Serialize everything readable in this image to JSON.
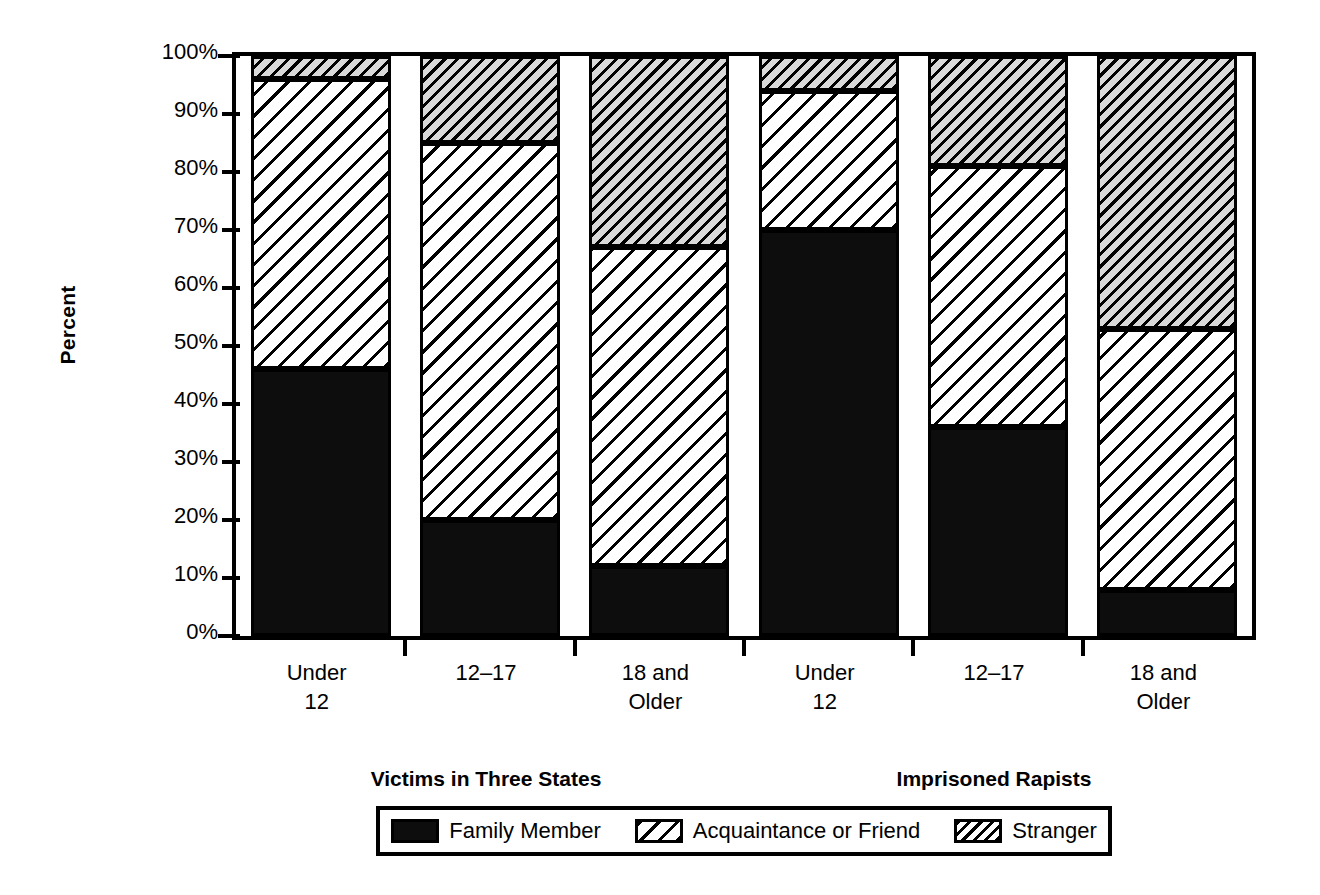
{
  "chart_data": {
    "type": "bar",
    "subtype": "stacked-percent",
    "title": "",
    "xlabel": "",
    "ylabel": "Percent",
    "ylim": [
      0,
      100
    ],
    "yticks": [
      0,
      10,
      20,
      30,
      40,
      50,
      60,
      70,
      80,
      90,
      100
    ],
    "ytick_labels": [
      "0%",
      "10%",
      "20%",
      "30%",
      "40%",
      "50%",
      "60%",
      "70%",
      "80%",
      "90%",
      "100%"
    ],
    "grid": false,
    "legend_position": "bottom",
    "categories": [
      "Under\n12",
      "12–17",
      "18 and\nOlder",
      "Under\n12",
      "12–17",
      "18 and\nOlder"
    ],
    "groups": [
      {
        "label": "Victims in Three States",
        "categories": [
          "Under\n12",
          "12–17",
          "18 and\nOlder"
        ]
      },
      {
        "label": "Imprisoned Rapists",
        "categories": [
          "Under\n12",
          "12–17",
          "18 and\nOlder"
        ]
      }
    ],
    "series": [
      {
        "name": "Family Member",
        "pattern": "solid",
        "color": "#0d0d0d",
        "values": [
          46,
          20,
          12,
          70,
          36,
          8
        ]
      },
      {
        "name": "Acquaintance or Friend",
        "pattern": "wide-diagonal-hatch",
        "color": "#ffffff",
        "values": [
          50,
          65,
          55,
          24,
          45,
          45
        ]
      },
      {
        "name": "Stranger",
        "pattern": "dense-diagonal-hatch",
        "color": "#d9d9d9",
        "values": [
          4,
          15,
          33,
          6,
          19,
          47
        ]
      }
    ],
    "bars": [
      {
        "group": "Victims in Three States",
        "category": "Under 12",
        "family_member": 46,
        "acquaintance_or_friend": 50,
        "stranger": 4
      },
      {
        "group": "Victims in Three States",
        "category": "12–17",
        "family_member": 20,
        "acquaintance_or_friend": 65,
        "stranger": 15
      },
      {
        "group": "Victims in Three States",
        "category": "18 and Older",
        "family_member": 12,
        "acquaintance_or_friend": 55,
        "stranger": 33
      },
      {
        "group": "Imprisoned Rapists",
        "category": "Under 12",
        "family_member": 70,
        "acquaintance_or_friend": 24,
        "stranger": 6
      },
      {
        "group": "Imprisoned Rapists",
        "category": "12–17",
        "family_member": 36,
        "acquaintance_or_friend": 45,
        "stranger": 19
      },
      {
        "group": "Imprisoned Rapists",
        "category": "18 and Older",
        "family_member": 8,
        "acquaintance_or_friend": 45,
        "stranger": 47
      }
    ]
  },
  "axis": {
    "y_title": "Percent",
    "y_tick_labels": [
      "100%",
      "90%",
      "80%",
      "70%",
      "60%",
      "50%",
      "40%",
      "30%",
      "20%",
      "10%",
      "0%"
    ]
  },
  "xcats": {
    "c0": "Under\n12",
    "c1": "12–17",
    "c2": "18 and\nOlder",
    "c3": "Under\n12",
    "c4": "12–17",
    "c5": "18 and\nOlder"
  },
  "groups": {
    "g0": "Victims in Three States",
    "g1": "Imprisoned Rapists"
  },
  "legend": {
    "items": [
      {
        "label": "Family Member"
      },
      {
        "label": "Acquaintance or Friend"
      },
      {
        "label": "Stranger"
      }
    ]
  },
  "colors": {
    "family_member": "#0d0d0d",
    "acquaintance_fill": "#ffffff",
    "stranger_fill": "#d9d9d9",
    "axis": "#000000"
  }
}
